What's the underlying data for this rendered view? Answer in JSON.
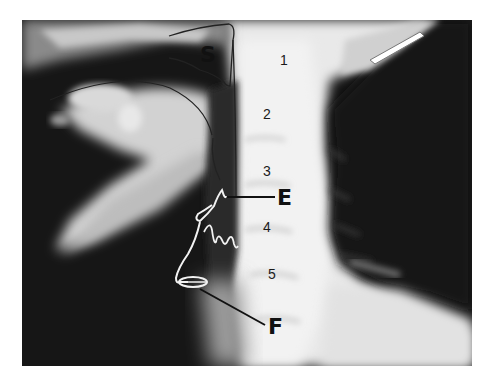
{
  "figure": {
    "colors": {
      "background": "#ffffff",
      "dark": "#151515",
      "bone": "#e8e8e8",
      "outline_dark": "#222222",
      "outline_light": "#f4f4f4"
    },
    "labels": {
      "S": "S",
      "E": "E",
      "F": "F"
    },
    "vertebrae": [
      "1",
      "2",
      "3",
      "4",
      "5"
    ]
  }
}
